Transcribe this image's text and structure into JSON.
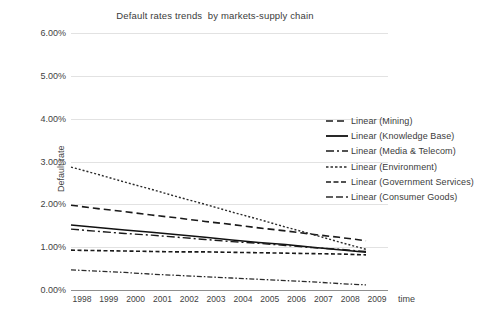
{
  "chart_data": {
    "type": "line",
    "title": "Default rates trends  by markets-supply chain",
    "xlabel": "time",
    "ylabel": "Default rate",
    "x": [
      1998,
      1999,
      2000,
      2001,
      2002,
      2003,
      2004,
      2005,
      2006,
      2007,
      2008,
      2009
    ],
    "categories": [
      "1998",
      "1999",
      "2000",
      "2001",
      "2002",
      "2003",
      "2004",
      "2005",
      "2006",
      "2007",
      "2008",
      "2009"
    ],
    "ylim": [
      0.0,
      6.0
    ],
    "yticks": [
      0.0,
      1.0,
      2.0,
      3.0,
      4.0,
      5.0,
      6.0
    ],
    "ytick_labels": [
      "0.00%",
      "1.00%",
      "2.00%",
      "3.00%",
      "4.00%",
      "5.00%",
      "6.00%"
    ],
    "y_unit": "%",
    "grid": true,
    "grid_axis": "y",
    "legend_position": "right",
    "series": [
      {
        "name": "Linear (Mining)",
        "short_name": "Mining",
        "dash": "long-dash",
        "dasharray": "7,4",
        "width": 1.6,
        "color": "#1a1a1a",
        "start_value": 1.98,
        "end_value": 1.15,
        "values": [
          1.98,
          1.9,
          1.83,
          1.75,
          1.68,
          1.6,
          1.53,
          1.45,
          1.38,
          1.3,
          1.23,
          1.15
        ]
      },
      {
        "name": "Linear (Knowledge Base)",
        "short_name": "Knowledge Base",
        "dash": "solid",
        "dasharray": "",
        "width": 1.5,
        "color": "#111111",
        "start_value": 1.52,
        "end_value": 0.88,
        "values": [
          1.52,
          1.46,
          1.4,
          1.35,
          1.29,
          1.23,
          1.17,
          1.11,
          1.06,
          1.0,
          0.94,
          0.88
        ]
      },
      {
        "name": "Linear (Media & Telecom)",
        "short_name": "Media & Telecom",
        "dash": "dash-dot",
        "dasharray": "8,3,2,3",
        "width": 1.4,
        "color": "#1a1a1a",
        "start_value": 1.42,
        "end_value": 0.9,
        "values": [
          1.42,
          1.37,
          1.32,
          1.28,
          1.23,
          1.18,
          1.13,
          1.09,
          1.04,
          0.99,
          0.95,
          0.9
        ]
      },
      {
        "name": "Linear (Environment)",
        "short_name": "Environment",
        "dash": "fine-dot",
        "dasharray": "2,2",
        "width": 1.4,
        "color": "#2b2b2b",
        "start_value": 2.87,
        "end_value": 0.95,
        "values": [
          2.87,
          2.7,
          2.52,
          2.35,
          2.17,
          2.0,
          1.82,
          1.65,
          1.47,
          1.3,
          1.12,
          0.95
        ]
      },
      {
        "name": "Linear (Government Services)",
        "short_name": "Government Services",
        "dash": "dense-dash",
        "dasharray": "4,2.5",
        "width": 1.6,
        "color": "#1a1a1a",
        "start_value": 0.93,
        "end_value": 0.82,
        "values": [
          0.93,
          0.92,
          0.91,
          0.9,
          0.89,
          0.89,
          0.88,
          0.87,
          0.86,
          0.85,
          0.84,
          0.82
        ]
      },
      {
        "name": "Linear (Consumer Goods)",
        "short_name": "Consumer Goods",
        "dash": "fine-dash-dot",
        "dasharray": "5,2,1.5,2",
        "width": 1.3,
        "color": "#2b2b2b",
        "start_value": 0.47,
        "end_value": 0.12,
        "values": [
          0.47,
          0.44,
          0.41,
          0.37,
          0.34,
          0.31,
          0.28,
          0.25,
          0.22,
          0.19,
          0.15,
          0.12
        ]
      }
    ]
  },
  "legend": {
    "items": [
      {
        "label": "Linear (Mining)",
        "dasharray": "7,4",
        "width": 1.6,
        "color": "#1a1a1a"
      },
      {
        "label": "Linear (Knowledge Base)",
        "dasharray": "",
        "width": 1.8,
        "color": "#111111"
      },
      {
        "label": "Linear (Media & Telecom)",
        "dasharray": "8,3,2,3",
        "width": 1.7,
        "color": "#1a1a1a"
      },
      {
        "label": "Linear (Environment)",
        "dasharray": "2.5,2",
        "width": 1.4,
        "color": "#2b2b2b"
      },
      {
        "label": "Linear (Government Services)",
        "dasharray": "5,2.5",
        "width": 1.5,
        "color": "#1a1a1a"
      },
      {
        "label": "Linear (Consumer Goods)",
        "dasharray": "7,3",
        "width": 1.5,
        "color": "#2b2b2b"
      }
    ]
  },
  "colors": {
    "background": "#ffffff",
    "gridline": "#e2e2e2",
    "axis": "#8e8e8e",
    "text": "#3f3f3f",
    "title_text": "#3b3b3b"
  }
}
